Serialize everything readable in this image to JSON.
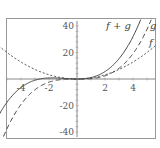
{
  "chart_data": {
    "type": "line",
    "title": "",
    "xlabel": "",
    "ylabel": "",
    "xlim": [
      -5.5,
      5.5
    ],
    "ylim": [
      -42,
      42
    ],
    "x_ticks": [
      -4,
      -2,
      2,
      4
    ],
    "x_tick_labels": [
      "-4",
      "-2",
      "2",
      "4"
    ],
    "y_ticks": [
      -40,
      -20,
      20,
      40
    ],
    "y_tick_labels": [
      "-40",
      "-20",
      "20",
      "40"
    ],
    "grid": false,
    "legend": "inline curve labels at upper right",
    "series": [
      {
        "name": "f+g",
        "style": "solid",
        "x": [
          -5.5,
          -4,
          -2,
          -1,
          0,
          1,
          2,
          3,
          4
        ],
        "y": [
          -18,
          -6.4,
          0.8,
          0.5,
          0,
          1.1,
          5.6,
          15.3,
          32
        ]
      },
      {
        "name": "g",
        "style": "long-dash",
        "x": [
          -5,
          -4,
          -2,
          0,
          2,
          4,
          5
        ],
        "y": [
          -37.5,
          -19.2,
          -2.4,
          0,
          2.4,
          19.2,
          37.5
        ]
      },
      {
        "name": "f",
        "style": "short-dash",
        "x": [
          -5.5,
          -4,
          -2,
          0,
          2,
          4,
          5.2
        ],
        "y": [
          24.2,
          12.8,
          3.2,
          0,
          3.2,
          12.8,
          21.6
        ]
      }
    ],
    "labels": {
      "fg": "f + g",
      "g": "g",
      "f": "f"
    }
  }
}
